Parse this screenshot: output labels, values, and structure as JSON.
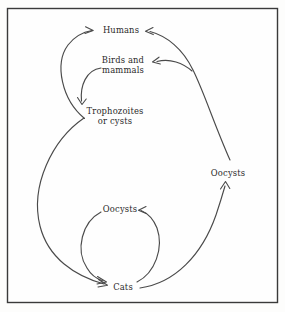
{
  "figure": {
    "frame": {
      "stroke_color": "#3a3a3a",
      "background": "#fefefe"
    },
    "stroke_color": "#4a4a4a",
    "text_color": "#2b2b2b"
  },
  "nodes": [
    {
      "id": "humans",
      "label": "Humans",
      "lines": [
        "Humans"
      ],
      "x": 121,
      "y": 30
    },
    {
      "id": "birds-mammals",
      "label": "Birds and mammals",
      "lines": [
        "Birds and",
        "mammals"
      ],
      "x": 123,
      "y": 65
    },
    {
      "id": "trophozoites",
      "label": "Trophozoites or cysts",
      "lines": [
        "Trophozoites",
        "or cysts"
      ],
      "x": 115,
      "y": 116
    },
    {
      "id": "oocysts-right",
      "label": "Oocysts",
      "lines": [
        "Oocysts"
      ],
      "x": 228,
      "y": 173
    },
    {
      "id": "oocysts-lower",
      "label": "Oocysts",
      "lines": [
        "Oocysts"
      ],
      "x": 120,
      "y": 209
    },
    {
      "id": "cats",
      "label": "Cats",
      "lines": [
        "Cats"
      ],
      "x": 123,
      "y": 287
    }
  ],
  "edges": [
    {
      "id": "trophozoites-to-humans",
      "from": "trophozoites",
      "to": "humans",
      "arrowhead": "humans"
    },
    {
      "id": "birds-to-trophozoites",
      "from": "birds-mammals",
      "to": "trophozoites",
      "arrowhead": "trophozoites"
    },
    {
      "id": "oocysts-right-to-humans",
      "from": "oocysts-right",
      "to": "humans",
      "arrowhead": "humans"
    },
    {
      "id": "oocysts-right-to-birds",
      "from": "oocysts-right",
      "to": "birds-mammals",
      "arrowhead": "birds-mammals"
    },
    {
      "id": "trophozoites-to-cats",
      "from": "trophozoites",
      "to": "cats",
      "arrowhead": "cats"
    },
    {
      "id": "oocysts-lower-to-cats",
      "from": "oocysts-lower",
      "to": "cats",
      "arrowhead": "cats"
    },
    {
      "id": "cats-to-oocysts-lower",
      "from": "cats",
      "to": "oocysts-lower",
      "arrowhead": "oocysts-lower"
    },
    {
      "id": "cats-to-oocysts-right",
      "from": "cats",
      "to": "oocysts-right",
      "arrowhead": "oocysts-right"
    }
  ]
}
